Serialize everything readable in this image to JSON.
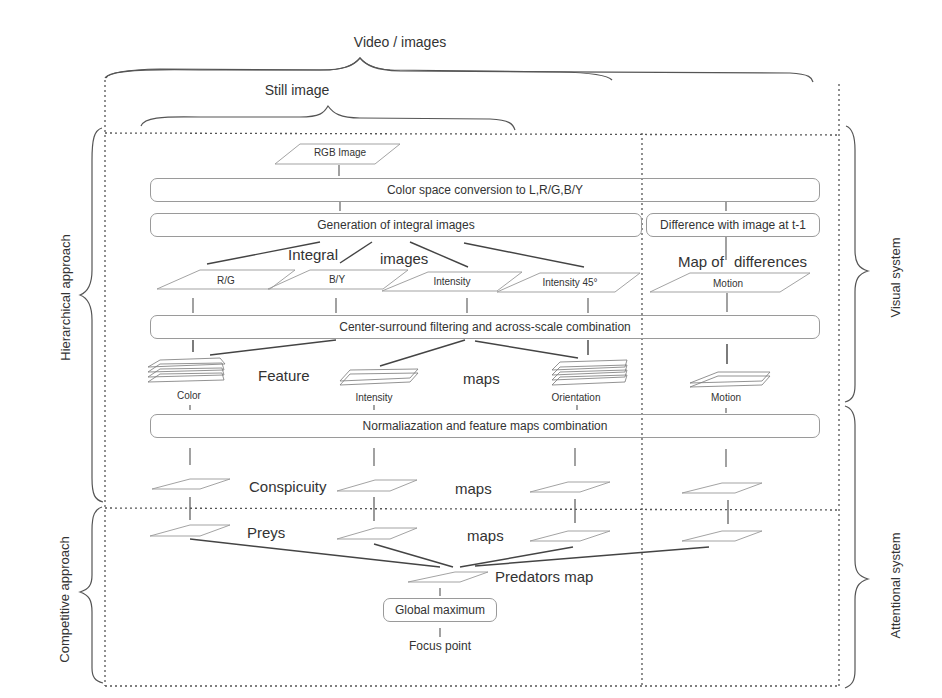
{
  "braces": {
    "top_outer": "Video / images",
    "top_inner": "Still image",
    "left_upper": "Hierarchical approach",
    "left_lower": "Competitive approach",
    "right_upper": "Visual system",
    "right_lower": "Attentional system"
  },
  "input": {
    "rgb": "RGB Image"
  },
  "process_boxes": {
    "color_space": "Color space conversion to L,R/G,B/Y",
    "integral": "Generation of integral images",
    "difference": "Difference with image at t-1",
    "center_surround": "Center-surround filtering and across-scale combination",
    "normalization": "Normalization and feature maps combination",
    "global_max": "Global maximum"
  },
  "normalization_text": "Normaliazation and feature maps combination",
  "group_labels": {
    "integral_1": "Integral",
    "integral_2": "images",
    "map_of": "Map of",
    "differences": "differences",
    "feature": "Feature",
    "feature_maps": "maps",
    "conspicuity": "Conspicuity",
    "conspicuity_maps": "maps",
    "preys": "Preys",
    "preys_maps": "maps",
    "predators": "Predators map"
  },
  "integral_images": [
    "R/G",
    "B/Y",
    "Intensity",
    "Intensity 45°"
  ],
  "motion_input": "Motion",
  "feature_maps": [
    "Color",
    "Intensity",
    "Orientation",
    "Motion"
  ],
  "output": {
    "focus": "Focus point"
  }
}
